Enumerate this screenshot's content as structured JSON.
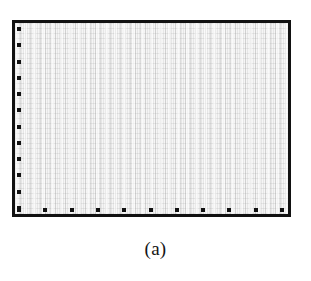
{
  "figure": {
    "caption": "(a)",
    "frame_color": "#111111",
    "plot_background": "#f4f4f4",
    "page_background": "#ffffff",
    "grid_visible": true,
    "data_series_present": false
  },
  "chart_data": {
    "type": "line",
    "title": "",
    "subtitle": "",
    "xlabel": "",
    "ylabel": "",
    "caption": "(a)",
    "grid": true,
    "legend": null,
    "legend_position": "none",
    "annotations": [],
    "series": [],
    "x": [],
    "values": [],
    "xlim": [
      0,
      10
    ],
    "ylim": [
      0,
      11
    ],
    "x_tick_labels": [
      "",
      "",
      "",
      "",
      "",
      "",
      "",
      "",
      "",
      "",
      ""
    ],
    "y_tick_labels": [
      "",
      "",
      "",
      "",
      "",
      "",
      "",
      "",
      "",
      "",
      "",
      ""
    ],
    "x_tick_positions": [
      0,
      1,
      2,
      3,
      4,
      5,
      6,
      7,
      8,
      9,
      10
    ],
    "y_tick_positions": [
      0,
      1,
      2,
      3,
      4,
      5,
      6,
      7,
      8,
      9,
      10,
      11
    ],
    "x_tick_count": 11,
    "y_tick_count": 12,
    "tick_style": "square-marker-inside"
  }
}
